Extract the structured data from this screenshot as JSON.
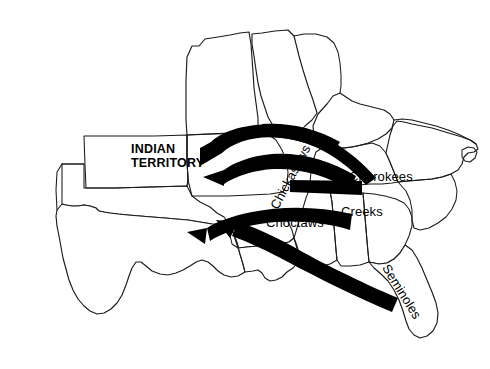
{
  "map": {
    "title": "Indian Removal to Indian Territory",
    "region": "Southeastern United States and Indian Territory",
    "background_color": "#ffffff",
    "ink_color": "#000000",
    "outline_color": "#1a1a1a"
  },
  "labels": {
    "indian_territory_line1": "INDIAN",
    "indian_territory_line2": "TERRITORY",
    "chickasaws": "Chickasaws",
    "cherokees": "Cherokees",
    "choctaws": "Choctaws",
    "creeks": "Creeks",
    "seminoles": "Seminoles"
  },
  "tribes": [
    {
      "name": "Chickasaws",
      "label_rotation_deg": -62,
      "label_x": 268,
      "label_y": 205,
      "origin": "northern Mississippi",
      "destination": "Indian Territory"
    },
    {
      "name": "Cherokees",
      "label_rotation_deg": 0,
      "label_x": 349,
      "label_y": 170,
      "origin": "Georgia / western North Carolina",
      "destination": "Indian Territory"
    },
    {
      "name": "Choctaws",
      "label_rotation_deg": 0,
      "label_x": 266,
      "label_y": 216,
      "origin": "central Mississippi",
      "destination": "Indian Territory"
    },
    {
      "name": "Creeks",
      "label_rotation_deg": 0,
      "label_x": 341,
      "label_y": 205,
      "origin": "Alabama",
      "destination": "Indian Territory"
    },
    {
      "name": "Seminoles",
      "label_rotation_deg": -58,
      "label_x": 391,
      "label_y": 262,
      "origin": "Florida",
      "destination": "Indian Territory"
    }
  ],
  "arrows": [
    {
      "name": "cherokee-removal-route",
      "from_tribe": "Cherokees",
      "direction": "east to west, arcing north",
      "arrowhead_at": "Indian Territory"
    },
    {
      "name": "chickasaw-removal-route",
      "from_tribe": "Chickasaws",
      "direction": "east to west",
      "arrowhead_at": "Indian Territory"
    },
    {
      "name": "creek-removal-route",
      "from_tribe": "Creeks",
      "direction": "east to west",
      "arrowhead_at": "Indian Territory"
    },
    {
      "name": "choctaw-removal-route",
      "from_tribe": "Choctaws",
      "direction": "southeast to northwest",
      "arrowhead_at": "Indian Territory"
    },
    {
      "name": "seminole-removal-route",
      "from_tribe": "Seminoles",
      "direction": "southeast to northwest from Florida",
      "arrowhead_at": "Indian Territory"
    }
  ]
}
